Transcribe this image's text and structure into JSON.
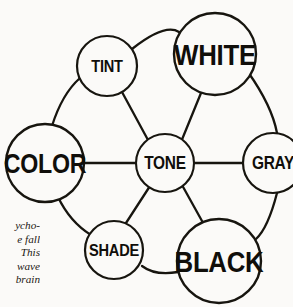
{
  "diagram": {
    "type": "hub-and-spoke-wheel",
    "background_color": "#fbfaf8",
    "line_color": "#17150f",
    "hub": {
      "id": "tone",
      "label": "TONE",
      "cx": 165,
      "cy": 163,
      "r": 29,
      "font_size": 18,
      "stroke_width": 2.1
    },
    "nodes": [
      {
        "id": "tint",
        "label": "TINT",
        "cx": 107,
        "cy": 66,
        "r": 30,
        "font_size": 17,
        "stroke_width": 2.2
      },
      {
        "id": "white",
        "label": "WHITE",
        "cx": 215,
        "cy": 54,
        "r": 41,
        "font_size": 30,
        "stroke_width": 2.4
      },
      {
        "id": "gray",
        "label": "GRAY",
        "cx": 273,
        "cy": 163,
        "r": 30,
        "font_size": 18,
        "stroke_width": 2.2
      },
      {
        "id": "black",
        "label": "BLACK",
        "cx": 219,
        "cy": 261,
        "r": 42,
        "font_size": 30,
        "stroke_width": 2.4
      },
      {
        "id": "shade",
        "label": "SHADE",
        "cx": 114,
        "cy": 250,
        "r": 29,
        "font_size": 17,
        "stroke_width": 2.2
      },
      {
        "id": "color",
        "label": "COLOR",
        "cx": 45,
        "cy": 163,
        "r": 39,
        "font_size": 27,
        "stroke_width": 2.4
      }
    ],
    "spokes": [
      {
        "id": "spoke-tone-tint",
        "from": "tone",
        "to": "tint",
        "d": "M 148 140 L 122 92",
        "stroke_width": 2.3
      },
      {
        "id": "spoke-tone-white",
        "from": "tone",
        "to": "white",
        "d": "M 181 142 L 201 93",
        "stroke_width": 2.3
      },
      {
        "id": "spoke-tone-gray",
        "from": "tone",
        "to": "gray",
        "d": "M 194 163 L 243 163",
        "stroke_width": 2.3
      },
      {
        "id": "spoke-tone-black",
        "from": "tone",
        "to": "black",
        "d": "M 182 185 L 202 221",
        "stroke_width": 2.3
      },
      {
        "id": "spoke-tone-shade",
        "from": "tone",
        "to": "shade",
        "d": "M 150 186 L 126 223",
        "stroke_width": 2.3
      },
      {
        "id": "spoke-tone-color",
        "from": "tone",
        "to": "color",
        "d": "M 136 163 L 84 163",
        "stroke_width": 2.3
      }
    ],
    "rim_arcs": [
      {
        "id": "rim-tint-white",
        "from": "tint",
        "to": "white",
        "d": "M 132 49 Q 165 23 179 32",
        "stroke_width": 2.3
      },
      {
        "id": "rim-white-gray",
        "from": "white",
        "to": "gray",
        "d": "M 248 72 Q 272 106 277 133",
        "stroke_width": 2.3
      },
      {
        "id": "rim-gray-black",
        "from": "gray",
        "to": "black",
        "d": "M 277 193 Q 268 228 256 239",
        "stroke_width": 2.3
      },
      {
        "id": "rim-black-shade",
        "from": "black",
        "to": "shade",
        "d": "M 178 272 Q 155 276 142 266",
        "stroke_width": 2.3
      },
      {
        "id": "rim-shade-color",
        "from": "shade",
        "to": "color",
        "d": "M 91 235 Q 70 222 58 197",
        "stroke_width": 2.3
      },
      {
        "id": "rim-color-tint",
        "from": "color",
        "to": "tint",
        "d": "M 52 126 Q 62 94 80 78",
        "stroke_width": 2.3
      }
    ]
  },
  "caption": {
    "lines": [
      "ycho-",
      "e fall",
      "This",
      "wave",
      "brain"
    ]
  }
}
